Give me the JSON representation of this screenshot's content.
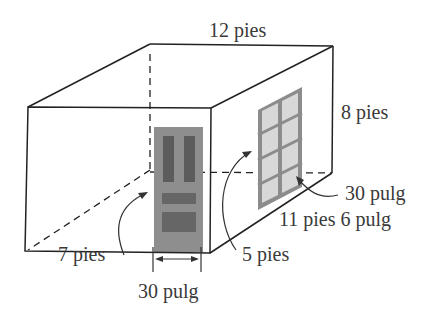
{
  "diagram": {
    "type": "3d-box-room",
    "labels": {
      "length": "12 pies",
      "height": "8 pies",
      "window_width": "30 pulg",
      "width": "11 pies 6 pulg",
      "door_height": "7 pies",
      "window_height": "5 pies",
      "door_width": "30 pulg"
    },
    "colors": {
      "line": "#222222",
      "door": "#8a8a8a",
      "door_panel": "#5e5e5e",
      "window_frame": "#8c8c8c",
      "window_glass": "#d6d6d6",
      "text": "#3a3a3a"
    }
  }
}
